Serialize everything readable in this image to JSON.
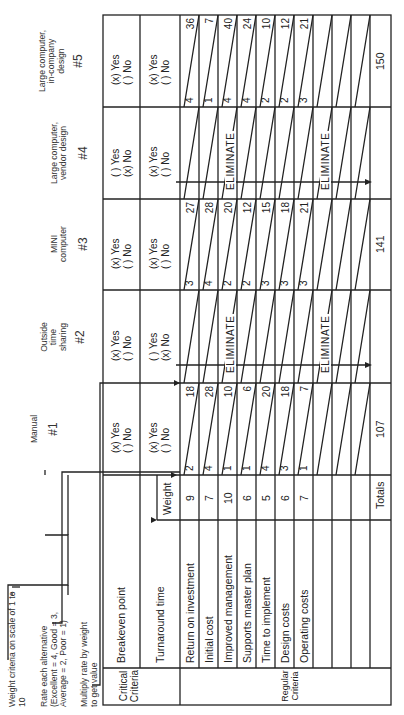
{
  "notes": {
    "weight": "Weight criteria on scale of 1 to 10",
    "rate_line1": "Rate each alternative",
    "rate_line2": "(Excellent = 4, Good = 3,",
    "rate_line3": "Average = 2, Poor = 1)",
    "multiply_line1": "Multiply rate by weight",
    "multiply_line2": "to get value"
  },
  "sections": {
    "critical": "Critical Criteria",
    "critical_line1": "Critical",
    "critical_line2": "Criteria",
    "regular": "Regular Criteria",
    "weight_header": "Weight",
    "totals_label": "Totals",
    "eliminate": "ELIMINATE"
  },
  "critical_criteria": [
    "Breakeven point",
    "Turnaround time"
  ],
  "regular_criteria": [
    {
      "label": "Return on investment",
      "weight": "9"
    },
    {
      "label": "Initial cost",
      "weight": "7"
    },
    {
      "label": "Improved management",
      "weight": "10"
    },
    {
      "label": "Supports master plan",
      "weight": "6"
    },
    {
      "label": "Time to implement",
      "weight": "5"
    },
    {
      "label": "Design costs",
      "weight": "6"
    },
    {
      "label": "Operating costs",
      "weight": "7"
    },
    {
      "label": "",
      "weight": ""
    },
    {
      "label": "",
      "weight": ""
    },
    {
      "label": "",
      "weight": ""
    }
  ],
  "alternatives": [
    {
      "number": "#1",
      "name_line1": "Manual",
      "name_line2": "",
      "name_line3": "",
      "breakeven_yes": "(x) Yes",
      "breakeven_no": "( ) No",
      "turnaround_yes": "(x) Yes",
      "turnaround_no": "( ) No",
      "eliminated": false,
      "rates": [
        "2",
        "4",
        "1",
        "1",
        "4",
        "3",
        "1"
      ],
      "values": [
        "18",
        "28",
        "10",
        "6",
        "20",
        "18",
        "7"
      ],
      "total": "107"
    },
    {
      "number": "#2",
      "name_line1": "Outside",
      "name_line2": "time",
      "name_line3": "sharing",
      "breakeven_yes": "(x) Yes",
      "breakeven_no": "( ) No",
      "turnaround_yes": "( ) Yes",
      "turnaround_no": "(x) No",
      "eliminated": true,
      "rates": [],
      "values": [],
      "total": ""
    },
    {
      "number": "#3",
      "name_line1": "MINI",
      "name_line2": "computer",
      "name_line3": "",
      "breakeven_yes": "(x) Yes",
      "breakeven_no": "( ) No",
      "turnaround_yes": "(x) Yes",
      "turnaround_no": "( ) No",
      "eliminated": false,
      "rates": [
        "3",
        "4",
        "2",
        "2",
        "3",
        "3",
        "3"
      ],
      "values": [
        "27",
        "28",
        "20",
        "12",
        "15",
        "18",
        "21"
      ],
      "total": "141"
    },
    {
      "number": "#4",
      "name_line1": "Large computer,",
      "name_line2": "vendor design",
      "name_line3": "",
      "breakeven_yes": "( ) Yes",
      "breakeven_no": "(x) No",
      "turnaround_yes": "(x) Yes",
      "turnaround_no": "( ) No",
      "eliminated": true,
      "rates": [],
      "values": [],
      "total": ""
    },
    {
      "number": "#5",
      "name_line1": "Large computer,",
      "name_line2": "in-company",
      "name_line3": "design",
      "breakeven_yes": "(x) Yes",
      "breakeven_no": "( ) No",
      "turnaround_yes": "(x) Yes",
      "turnaround_no": "( ) No",
      "eliminated": false,
      "rates": [
        "4",
        "1",
        "4",
        "4",
        "2",
        "2",
        "3"
      ],
      "values": [
        "36",
        "7",
        "40",
        "24",
        "10",
        "12",
        "21"
      ],
      "total": "150"
    }
  ]
}
